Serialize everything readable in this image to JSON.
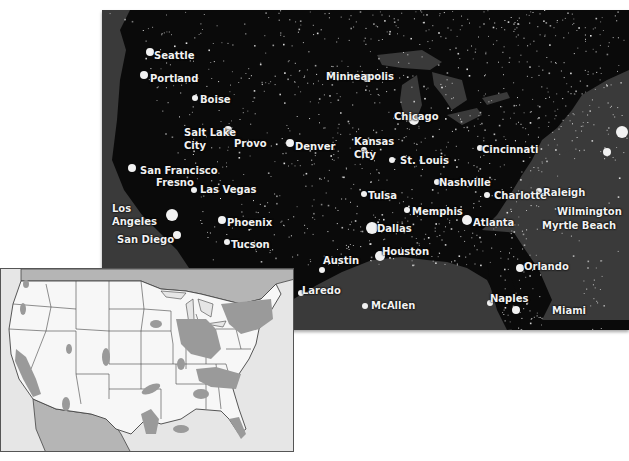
{
  "night_map": {
    "description": "Satellite night-lights image of the contiguous United States",
    "colors": {
      "land": "#0a0a0a",
      "water": "#3a3a3a",
      "lights": "#e8e8e8"
    },
    "cities": [
      {
        "name": "Seattle",
        "x": 52,
        "y": 40
      },
      {
        "name": "Portland",
        "x": 48,
        "y": 63
      },
      {
        "name": "Boise",
        "x": 98,
        "y": 84
      },
      {
        "name": "Salt Lake",
        "x": 82,
        "y": 117
      },
      {
        "name": "City",
        "x": 82,
        "y": 130
      },
      {
        "name": "Provo",
        "x": 132,
        "y": 128
      },
      {
        "name": "Denver",
        "x": 193,
        "y": 131
      },
      {
        "name": "Minneapolis",
        "x": 224,
        "y": 61
      },
      {
        "name": "Chicago",
        "x": 292,
        "y": 101
      },
      {
        "name": "Kansas",
        "x": 252,
        "y": 126
      },
      {
        "name": "City",
        "x": 252,
        "y": 139
      },
      {
        "name": "St. Louis",
        "x": 298,
        "y": 145
      },
      {
        "name": "Cincinnati",
        "x": 380,
        "y": 134
      },
      {
        "name": "Boston",
        "x": 546,
        "y": 92
      },
      {
        "name": "New York",
        "x": 541,
        "y": 117
      },
      {
        "name": "Washington, D.C.",
        "x": 548,
        "y": 141
      },
      {
        "name": "San Francisco",
        "x": 38,
        "y": 155
      },
      {
        "name": "Fresno",
        "x": 54,
        "y": 167
      },
      {
        "name": "Las Vegas",
        "x": 98,
        "y": 174
      },
      {
        "name": "Los",
        "x": 10,
        "y": 193
      },
      {
        "name": "Angeles",
        "x": 10,
        "y": 206
      },
      {
        "name": "San Diego",
        "x": 15,
        "y": 224
      },
      {
        "name": "Phoenix",
        "x": 125,
        "y": 207
      },
      {
        "name": "Tucson",
        "x": 129,
        "y": 229
      },
      {
        "name": "Nashville",
        "x": 337,
        "y": 167
      },
      {
        "name": "Tulsa",
        "x": 266,
        "y": 180
      },
      {
        "name": "Memphis",
        "x": 310,
        "y": 196
      },
      {
        "name": "Charlotte",
        "x": 392,
        "y": 180
      },
      {
        "name": "Raleigh",
        "x": 441,
        "y": 177
      },
      {
        "name": "Atlanta",
        "x": 371,
        "y": 207
      },
      {
        "name": "Wilmington",
        "x": 455,
        "y": 196
      },
      {
        "name": "Myrtle Beach",
        "x": 440,
        "y": 210
      },
      {
        "name": "Dallas",
        "x": 275,
        "y": 213
      },
      {
        "name": "Austin",
        "x": 221,
        "y": 245
      },
      {
        "name": "Houston",
        "x": 280,
        "y": 236
      },
      {
        "name": "Laredo",
        "x": 200,
        "y": 275
      },
      {
        "name": "Orlando",
        "x": 422,
        "y": 251
      },
      {
        "name": "McAllen",
        "x": 269,
        "y": 290
      },
      {
        "name": "Naples",
        "x": 388,
        "y": 283
      },
      {
        "name": "Miami",
        "x": 450,
        "y": 295
      }
    ]
  },
  "inset_map": {
    "description": "Reference map of US states with urban areas shaded gray",
    "colors": {
      "background": "#e6e6e6",
      "land": "#f7f7f7",
      "neighbor_land": "#b5b5b5",
      "urban": "#9a9a9a",
      "borders": "#444444"
    }
  }
}
